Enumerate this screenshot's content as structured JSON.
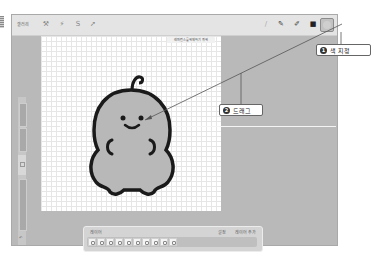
{
  "app": {
    "topbar": {
      "gallery_label": "갤러리",
      "left_tools": [
        {
          "icon": "wrench-icon",
          "glyph": "⚒"
        },
        {
          "icon": "magic-wand-icon",
          "glyph": "⚡"
        },
        {
          "icon": "selection-icon",
          "glyph": "S"
        },
        {
          "icon": "transform-icon",
          "glyph": "➚"
        }
      ],
      "right_tools": [
        {
          "icon": "brush-icon",
          "glyph": "/"
        },
        {
          "icon": "smudge-icon",
          "glyph": "✎"
        },
        {
          "icon": "eraser-icon",
          "glyph": "✐"
        },
        {
          "icon": "layers-icon",
          "glyph": "■"
        }
      ],
      "color_swatch": "#cfcfcf"
    },
    "toast": "레퍼런스를 해제하기 위해",
    "sidebar": {
      "undo_label": "↶"
    },
    "layer_panel": {
      "title": "레이어",
      "actions": [
        "설정",
        "레이어 추가"
      ],
      "frame_count": 10
    }
  },
  "annotations": [
    {
      "number": "1",
      "text": "색 지정"
    },
    {
      "number": "2",
      "text": "드래그"
    }
  ],
  "colors": {
    "character_fill": "#b8b8b8",
    "character_outline": "#1a1a1a",
    "workspace": "#b9b9b9"
  }
}
